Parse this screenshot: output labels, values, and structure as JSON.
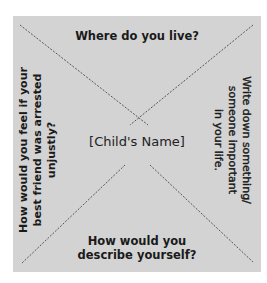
{
  "diagram": {
    "center": {
      "label": "[Child's Name]"
    },
    "quadrants": {
      "top": {
        "lines": [
          "Where do you live?"
        ]
      },
      "right": {
        "lines": [
          "Write down something/",
          "someone important",
          "in your life."
        ]
      },
      "bottom": {
        "lines": [
          "How would you",
          "describe yourself?"
        ]
      },
      "left": {
        "lines": [
          "How would you feel if your",
          "best friend was arrested",
          "unjustly?"
        ]
      }
    },
    "colors": {
      "background": "#d3d3d3",
      "lines": "#555555",
      "text": "#1a1a1a"
    },
    "divider_style": "dotted diagonals"
  }
}
